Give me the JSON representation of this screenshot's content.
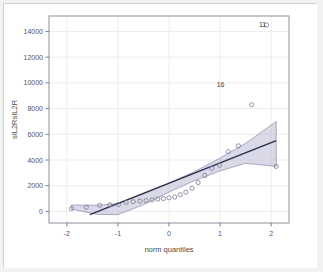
{
  "figure": {
    "background_color": "#ffffff",
    "border_color": "#cfcfcf",
    "panel_border_color": "#8f8f9e",
    "grid_color": "#ebebf0"
  },
  "chart_data": {
    "type": "scatter",
    "title": "",
    "subtitle": "",
    "xlabel": "norm quantiles",
    "ylabel": "sIL2RsIL2R",
    "xlim": [
      -2.35,
      2.35
    ],
    "ylim": [
      -900,
      15200
    ],
    "xticks": [
      -2,
      -1,
      0,
      1,
      2
    ],
    "xticklabels": [
      "-2",
      "-1",
      "0",
      "1",
      "2"
    ],
    "yticks": [
      0,
      2000,
      4000,
      6000,
      8000,
      10000,
      12000,
      14000
    ],
    "yticklabels": [
      "0",
      "2000",
      "4000",
      "6000",
      "8000",
      "10000",
      "12000",
      "14000"
    ],
    "grid": true,
    "legend": "none",
    "point_color": "#7b7b90",
    "point_fill": "none",
    "point_radius": 2.1,
    "line_color": "#2d2d4a",
    "line_width": 1.4,
    "band_fill": "#b9b9d4",
    "band_opacity": 0.55,
    "band_edge_color": "#8d8daa",
    "x": [
      -1.91,
      -1.62,
      -1.36,
      -1.16,
      -0.99,
      -0.84,
      -0.7,
      -0.57,
      -0.45,
      -0.33,
      -0.22,
      -0.11,
      0.0,
      0.11,
      0.22,
      0.33,
      0.45,
      0.57,
      0.7,
      0.84,
      0.99,
      1.16,
      1.36,
      1.62,
      1.91,
      2.1
    ],
    "y": [
      220,
      330,
      470,
      520,
      540,
      700,
      760,
      800,
      850,
      900,
      960,
      1000,
      1060,
      1120,
      1300,
      1500,
      1800,
      2250,
      2800,
      3350,
      3600,
      4650,
      5100,
      8300,
      14500,
      3500
    ],
    "reference_line": {
      "x": [
        -1.55,
        2.1
      ],
      "y": [
        -250,
        5500
      ]
    },
    "confidence_band": {
      "upper_x": [
        -1.91,
        -1.4,
        -1.0,
        -0.5,
        0.0,
        0.5,
        1.0,
        1.5,
        2.1
      ],
      "upper_y": [
        500,
        480,
        620,
        1350,
        2200,
        3100,
        4150,
        5300,
        7000
      ],
      "lower_x": [
        -1.91,
        -1.4,
        -1.0,
        -0.5,
        0.0,
        0.5,
        1.0,
        1.5,
        2.1
      ],
      "lower_y": [
        180,
        -230,
        -250,
        520,
        1500,
        2400,
        3150,
        3750,
        3500
      ]
    },
    "annotations": [
      {
        "label": "11",
        "x": 2.1,
        "y": 14500,
        "dx": -10,
        "dy": 2
      },
      {
        "label": "16",
        "x": 1.36,
        "y": 8300,
        "dx": -14,
        "dy": -18
      }
    ]
  }
}
